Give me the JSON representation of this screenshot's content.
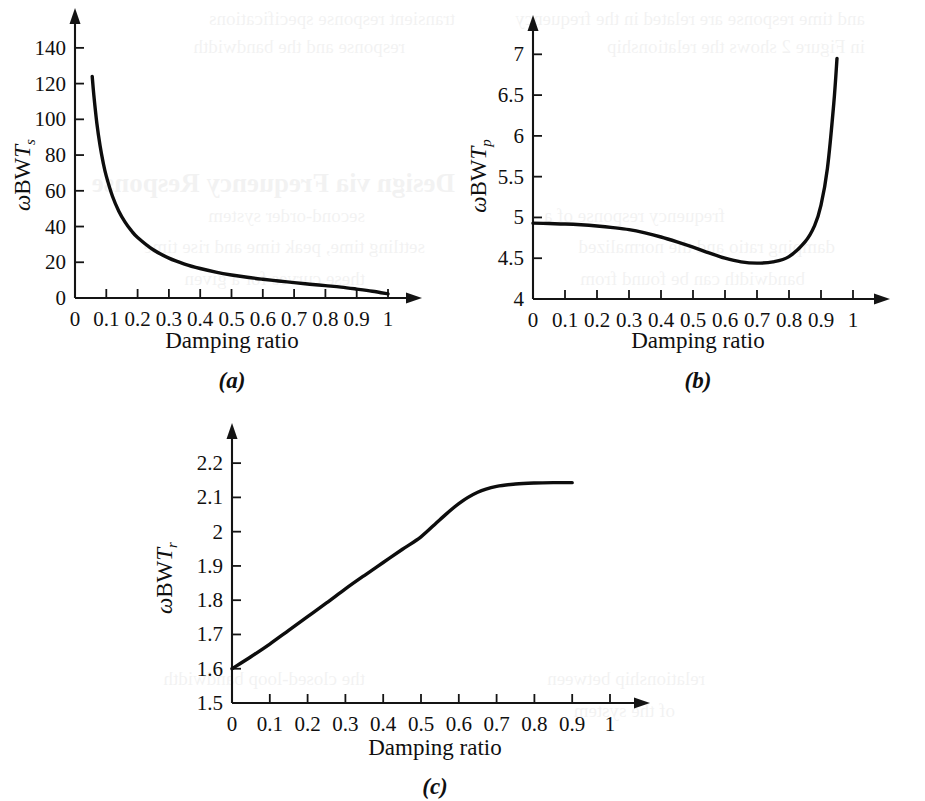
{
  "figure": {
    "background_color": "#ffffff",
    "ink_color": "#101010",
    "curve_color": "#0d0d0d"
  },
  "panels": [
    {
      "id": "a",
      "caption": "(a)",
      "xlabel": "Damping ratio",
      "ylabel_parts": {
        "omega": "ω",
        "bw": "BW",
        "symbol": "T",
        "subscript": "s"
      }
    },
    {
      "id": "b",
      "caption": "(b)",
      "xlabel": "Damping ratio",
      "ylabel_parts": {
        "omega": "ω",
        "bw": "BW",
        "symbol": "T",
        "subscript": "p"
      }
    },
    {
      "id": "c",
      "caption": "(c)",
      "xlabel": "Damping ratio",
      "ylabel_parts": {
        "omega": "ω",
        "bw": "BW",
        "symbol": "T",
        "subscript": "r"
      }
    }
  ],
  "showthrough": {
    "visible": true,
    "lines": [
      {
        "text": "Design via Frequency Response",
        "x": 470,
        "y": 168,
        "size": 27,
        "bold": true
      },
      {
        "text": "and time response are related in the frequency",
        "x": 60,
        "y": 8,
        "size": 19,
        "bold": false
      },
      {
        "text": "transient response specifications",
        "x": 470,
        "y": 8,
        "size": 19,
        "bold": false
      },
      {
        "text": "in Figure 2 shows the relationship",
        "x": 60,
        "y": 36,
        "size": 19,
        "bold": false
      },
      {
        "text": "response and the bandwidth",
        "x": 520,
        "y": 36,
        "size": 19,
        "bold": false
      },
      {
        "text": "frequency response of a",
        "x": 200,
        "y": 205,
        "size": 19,
        "bold": false
      },
      {
        "text": "second-order system",
        "x": 560,
        "y": 205,
        "size": 19,
        "bold": false
      },
      {
        "text": "damping ratio and the normalized",
        "x": 90,
        "y": 236,
        "size": 19,
        "bold": false
      },
      {
        "text": "settling time, peak time and rise time",
        "x": 500,
        "y": 236,
        "size": 19,
        "bold": false
      },
      {
        "text": "bandwidth can be found from",
        "x": 120,
        "y": 268,
        "size": 19,
        "bold": false
      },
      {
        "text": "these curves for a given",
        "x": 560,
        "y": 268,
        "size": 19,
        "bold": false
      },
      {
        "text": "relationship between",
        "x": 220,
        "y": 668,
        "size": 19,
        "bold": false
      },
      {
        "text": "the closed-loop bandwidth",
        "x": 560,
        "y": 668,
        "size": 19,
        "bold": false
      },
      {
        "text": "of the system",
        "x": 250,
        "y": 700,
        "size": 19,
        "bold": false
      }
    ]
  },
  "chart_data": [
    {
      "id": "a",
      "type": "line",
      "title": "(a)",
      "xlabel": "Damping ratio",
      "ylabel": "ωBWTs",
      "xlim": [
        0,
        1.06
      ],
      "ylim": [
        0,
        150
      ],
      "xticks": [
        0,
        0.1,
        0.2,
        0.3,
        0.4,
        0.5,
        0.6,
        0.7,
        0.8,
        0.9,
        1
      ],
      "xtick_labels": [
        "0",
        "0.1",
        "0.2",
        "0.3",
        "0.4",
        "0.5",
        "0.6",
        "0.7",
        "0.8",
        "0.9",
        "1"
      ],
      "yticks": [
        0,
        20,
        40,
        60,
        80,
        100,
        120,
        140
      ],
      "ytick_labels": [
        "0",
        "20",
        "40",
        "60",
        "80",
        "100",
        "120",
        "140"
      ],
      "grid": false,
      "legend": "none",
      "x": [
        0.055,
        0.06,
        0.07,
        0.08,
        0.09,
        0.1,
        0.12,
        0.14,
        0.16,
        0.18,
        0.2,
        0.25,
        0.3,
        0.35,
        0.4,
        0.45,
        0.5,
        0.55,
        0.6,
        0.65,
        0.7,
        0.75,
        0.8,
        0.85,
        0.9,
        0.95,
        1.0
      ],
      "y": [
        124.0,
        113.8,
        97.5,
        85.3,
        75.8,
        68.2,
        56.8,
        48.6,
        42.5,
        37.7,
        33.9,
        27.0,
        22.3,
        19.0,
        16.5,
        14.5,
        12.9,
        11.6,
        10.5,
        9.5,
        8.6,
        7.7,
        6.9,
        6.1,
        5.0,
        3.8,
        2.3
      ]
    },
    {
      "id": "b",
      "type": "line",
      "title": "(b)",
      "xlabel": "Damping ratio",
      "ylabel": "ωBWTp",
      "xlim": [
        0,
        1.06
      ],
      "ylim": [
        4,
        7.2
      ],
      "xticks": [
        0,
        0.1,
        0.2,
        0.3,
        0.4,
        0.5,
        0.6,
        0.7,
        0.8,
        0.9,
        1
      ],
      "xtick_labels": [
        "0",
        "0.1",
        "0.2",
        "0.3",
        "0.4",
        "0.5",
        "0.6",
        "0.7",
        "0.8",
        "0.9",
        "1"
      ],
      "yticks": [
        4,
        4.5,
        5,
        5.5,
        6,
        6.5,
        7
      ],
      "ytick_labels": [
        "4",
        "4.5",
        "5",
        "5.5",
        "6",
        "6.5",
        "7"
      ],
      "grid": false,
      "legend": "none",
      "x": [
        0.0,
        0.05,
        0.1,
        0.15,
        0.2,
        0.25,
        0.3,
        0.35,
        0.4,
        0.45,
        0.5,
        0.55,
        0.6,
        0.65,
        0.7,
        0.75,
        0.8,
        0.85,
        0.88,
        0.9,
        0.92,
        0.94,
        0.95
      ],
      "y": [
        4.93,
        4.925,
        4.92,
        4.91,
        4.895,
        4.875,
        4.85,
        4.81,
        4.76,
        4.7,
        4.635,
        4.565,
        4.5,
        4.455,
        4.44,
        4.455,
        4.52,
        4.7,
        4.9,
        5.15,
        5.6,
        6.4,
        6.95
      ],
      "minimum": {
        "x": 0.69,
        "y": 4.44
      }
    },
    {
      "id": "c",
      "type": "line",
      "title": "(c)",
      "xlabel": "Damping ratio",
      "ylabel": "ωBWTr",
      "xlim": [
        0,
        1.06
      ],
      "ylim": [
        1.5,
        2.25
      ],
      "xticks": [
        0,
        0.1,
        0.2,
        0.3,
        0.4,
        0.5,
        0.6,
        0.7,
        0.8,
        0.9,
        1
      ],
      "xtick_labels": [
        "0",
        "0.1",
        "0.2",
        "0.3",
        "0.4",
        "0.5",
        "0.6",
        "0.7",
        "0.8",
        "0.9",
        "1"
      ],
      "yticks": [
        1.5,
        1.6,
        1.7,
        1.8,
        1.9,
        2.0,
        2.1,
        2.2
      ],
      "ytick_labels": [
        "1.5",
        "1.6",
        "1.7",
        "1.8",
        "1.9",
        "2",
        "2.1",
        "2.2"
      ],
      "grid": false,
      "legend": "none",
      "x": [
        0.0,
        0.05,
        0.1,
        0.15,
        0.2,
        0.25,
        0.3,
        0.35,
        0.4,
        0.45,
        0.5,
        0.55,
        0.6,
        0.65,
        0.7,
        0.75,
        0.8,
        0.85,
        0.9
      ],
      "y": [
        1.6,
        1.635,
        1.672,
        1.712,
        1.752,
        1.792,
        1.833,
        1.872,
        1.91,
        1.948,
        1.985,
        2.035,
        2.082,
        2.115,
        2.132,
        2.139,
        2.142,
        2.143,
        2.143
      ]
    }
  ]
}
